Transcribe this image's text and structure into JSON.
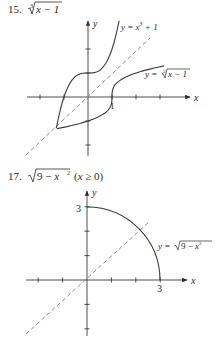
{
  "problems": [
    {
      "number": "15.",
      "expression": "∛(x − 1)",
      "expr_parts": {
        "root_index": "3",
        "radicand": "x − 1"
      },
      "axis_labels": {
        "x": "x",
        "y": "y"
      },
      "tick_labels": {
        "x_one": "1"
      },
      "curve_labels": [
        "y = x³ + 1",
        "y = ∛(x − 1)"
      ]
    },
    {
      "number": "17.",
      "expression": "√(9 − x²) (x ≥ 0)",
      "expr_parts": {
        "radicand": "9 − x",
        "exp": "2",
        "domain": "(x ≥ 0)"
      },
      "axis_labels": {
        "x": "x",
        "y": "y"
      },
      "tick_labels": {
        "x_three": "3",
        "y_three": "3"
      },
      "curve_labels": [
        "y = √(9 − x²)"
      ]
    }
  ],
  "chart_data": [
    {
      "type": "line",
      "title": "15. ∛(x − 1)",
      "xlabel": "x",
      "ylabel": "y",
      "xlim": [
        -2.5,
        4.2
      ],
      "ylim": [
        -2.4,
        3.2
      ],
      "grid": false,
      "ticks": {
        "x": [
          -2,
          -1,
          1,
          2,
          3
        ],
        "y": [
          -2,
          -1,
          1,
          2
        ]
      },
      "labeled_ticks": {
        "x": [
          1
        ]
      },
      "series": [
        {
          "name": "y = x³ + 1",
          "x_range": [
            -1.32,
            1.295
          ],
          "style": "solid"
        },
        {
          "name": "y = ∛(x − 1)",
          "x_range": [
            -1.3,
            3.17
          ],
          "style": "solid"
        },
        {
          "name": "y = x",
          "x_range": [
            -2.6,
            2.6
          ],
          "style": "dashed"
        }
      ],
      "annotations": [
        "y = x³ + 1",
        "y = ∛(x − 1)",
        "1"
      ]
    },
    {
      "type": "line",
      "title": "17. √(9 − x²) (x ≥ 0)",
      "xlabel": "x",
      "ylabel": "y",
      "xlim": [
        -2.5,
        4.1
      ],
      "ylim": [
        -2.3,
        3.6
      ],
      "grid": false,
      "ticks": {
        "x": [
          -2,
          -1,
          1,
          2,
          3
        ],
        "y": [
          -2,
          -1,
          1,
          2,
          3
        ]
      },
      "labeled_ticks": {
        "x": [
          3
        ],
        "y": [
          3
        ]
      },
      "series": [
        {
          "name": "y = √(9 − x²)",
          "x_range": [
            0,
            3
          ],
          "style": "solid"
        },
        {
          "name": "y = x",
          "x_range": [
            -2.5,
            2.6
          ],
          "style": "dashed"
        }
      ],
      "annotations": [
        "y = √(9 − x²)",
        "3",
        "3"
      ]
    }
  ]
}
